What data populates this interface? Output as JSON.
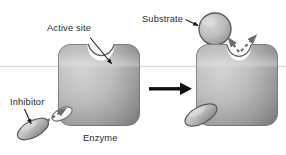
{
  "figure": {
    "type": "biology-process-diagram",
    "background_color": "#ffffff",
    "width": 286,
    "height": 155
  },
  "labels": {
    "active_site": "Active site",
    "substrate": "Substrate",
    "inhibitor": "Inhibitor",
    "enzyme": "Enzyme"
  },
  "colors": {
    "enzyme_light": "#c9c9c9",
    "enzyme_mid": "#a8a8a8",
    "enzyme_dark": "#7d7d7d",
    "enzyme_edge": "#6a6a6a",
    "substrate_light": "#cfcfcf",
    "substrate_dark": "#8f8f8f",
    "inhibitor_light": "#d2d2d2",
    "inhibitor_dark": "#8a8a8a",
    "outline": "#4a4a4a",
    "arrow_black": "#111111",
    "dashed_arrow": "#6d6d6d",
    "text": "#2b2b2b",
    "scan_line": "#dcdcdc"
  },
  "panels": [
    {
      "name": "left-panel",
      "description": "Free enzyme with open active site; inhibitor approaching the allosteric site",
      "enzyme": {
        "x": 58,
        "y": 44,
        "width": 82,
        "height": 82,
        "corner_radius": 13
      },
      "active_site": {
        "cx": 101,
        "cy": 44,
        "rx": 13,
        "ry": 15
      },
      "allosteric_notch": {
        "cx": 63,
        "cy": 113
      },
      "inhibitor": {
        "cx": 33,
        "cy": 129,
        "rx": 17,
        "ry": 8,
        "rotation_deg": -28
      },
      "moving": true
    },
    {
      "name": "right-panel",
      "description": "Inhibitor bound to allosteric site; active site distorted and substrate rejected",
      "enzyme": {
        "x": 196,
        "y": 44,
        "width": 82,
        "height": 82,
        "corner_radius": 13
      },
      "active_site": {
        "cx": 239,
        "cy": 46,
        "rx": 12,
        "ry": 13
      },
      "inhibitor": {
        "cx": 200,
        "cy": 115,
        "rx": 17,
        "ry": 8,
        "rotation_deg": -28
      },
      "bound": true
    }
  ],
  "substrate": {
    "cx": 215,
    "cy": 29,
    "r": 16,
    "state": "unbound"
  },
  "annotations": {
    "active_site_leader": {
      "from": [
        88,
        36
      ],
      "to": [
        112,
        64
      ],
      "style": "solid-arrow"
    },
    "substrate_leader": {
      "from": [
        186,
        20
      ],
      "to": [
        200,
        26
      ],
      "style": "solid-arrow"
    },
    "inhibitor_leader": {
      "from": [
        24,
        108
      ],
      "to": [
        32,
        124
      ],
      "style": "solid-arrow"
    },
    "inhibitor_motion_arrow": {
      "from": [
        48,
        120
      ],
      "to": [
        66,
        108
      ],
      "style": "dashed-arrow"
    },
    "rejection_arrows": [
      {
        "from": [
          243,
          52
        ],
        "to": [
          232,
          38
        ],
        "style": "dashed-arrow"
      },
      {
        "from": [
          243,
          52
        ],
        "to": [
          256,
          36
        ],
        "style": "dashed-arrow"
      }
    ],
    "process_arrow": {
      "from": [
        148,
        89
      ],
      "to": [
        190,
        89
      ],
      "style": "solid-block-arrow"
    }
  },
  "scan_line": {
    "y": 66,
    "color": "#dcdcdc",
    "spans_full_width": true
  }
}
